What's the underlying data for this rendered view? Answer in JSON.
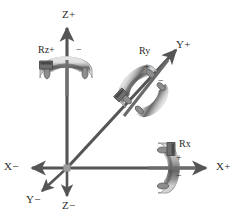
{
  "diagram": {
    "background_color": "#ffffff",
    "stroke_color": "#555555",
    "text_color": "#2a2a2a",
    "ring_light_color": "#d8d8d8",
    "ring_mid_color": "#9a9a9a",
    "ring_dark_color": "#5a5a5a",
    "origin": {
      "x": 67,
      "y": 168
    },
    "axes": [
      {
        "name": "z-positive",
        "label": "Z+",
        "direction": "up",
        "label_x": 62,
        "label_y": 8
      },
      {
        "name": "z-negative",
        "label": "Z−",
        "direction": "down",
        "label_x": 62,
        "label_y": 199
      },
      {
        "name": "x-positive",
        "label": "X+",
        "direction": "right",
        "label_x": 216,
        "label_y": 160
      },
      {
        "name": "x-negative",
        "label": "X−",
        "direction": "left",
        "label_x": 4,
        "label_y": 160
      },
      {
        "name": "y-positive",
        "label": "Y+",
        "direction": "up-right",
        "label_x": 176,
        "label_y": 38
      },
      {
        "name": "y-negative",
        "label": "Y−",
        "direction": "down-left",
        "label_x": 26,
        "label_y": 193
      }
    ],
    "rotations": [
      {
        "name": "rz",
        "label": "Rz+",
        "axis": "Z",
        "label_x": 38,
        "label_y": 44,
        "signs": [
          {
            "name": "rz-minus-sign",
            "text": "−",
            "x": 76,
            "y": 44
          }
        ]
      },
      {
        "name": "ry",
        "label": "Ry",
        "axis": "Y",
        "label_x": 139,
        "label_y": 45,
        "signs": [
          {
            "name": "ry-plus-sign",
            "text": "+",
            "x": 144,
            "y": 61
          },
          {
            "name": "ry-minus-sign",
            "text": "−",
            "x": 158,
            "y": 75
          }
        ]
      },
      {
        "name": "rx",
        "label": "Rx",
        "axis": "X",
        "label_x": 179,
        "label_y": 138,
        "signs": [
          {
            "name": "rx-plus-sign",
            "text": "+",
            "x": 176,
            "y": 152
          },
          {
            "name": "rx-minus-sign",
            "text": "−",
            "x": 176,
            "y": 170
          }
        ]
      }
    ]
  }
}
